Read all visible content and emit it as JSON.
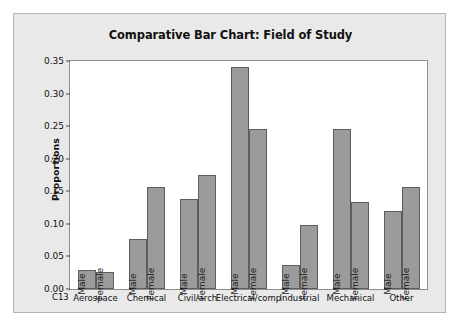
{
  "chart_data": {
    "type": "bar",
    "title": "Comparative Bar Chart: Field of Study",
    "xlabel": "C13",
    "ylabel": "Proportions",
    "ylim": [
      0,
      0.35
    ],
    "yticks": [
      "0.00",
      "0.05",
      "0.10",
      "0.15",
      "0.20",
      "0.25",
      "0.30",
      "0.35"
    ],
    "ytick_values": [
      0.0,
      0.05,
      0.1,
      0.15,
      0.2,
      0.25,
      0.3,
      0.35
    ],
    "grid": false,
    "legend": "none",
    "bar_labels_inside": true,
    "categories": [
      "Aerospace",
      "Chemical",
      "Civil/arch",
      "Electrical/comp",
      "Industrial",
      "Mechanical",
      "Other"
    ],
    "series": [
      {
        "name": "Male",
        "values": [
          0.029,
          0.077,
          0.138,
          0.341,
          0.037,
          0.245,
          0.12
        ]
      },
      {
        "name": "Female",
        "values": [
          0.026,
          0.157,
          0.175,
          0.245,
          0.099,
          0.133,
          0.157
        ]
      }
    ],
    "colors": {
      "bar_fill": "#9b9b9b",
      "bar_border": "#5d5d5d",
      "panel_background": "#e9e9e9",
      "plot_background": "#ffffff",
      "text": "#111111"
    }
  }
}
